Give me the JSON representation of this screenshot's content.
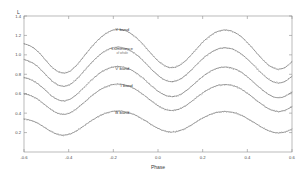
{
  "figure": {
    "background_color": "#ffffff",
    "frame_color": "#8d8d8d",
    "curve_color": "#6f6f6f",
    "point_color": "#5a5a5a"
  },
  "chart_data": {
    "type": "line",
    "title": "",
    "subtitle": "",
    "xlabel": "Phase",
    "ylabel": "L",
    "xlim": [
      -0.6,
      0.6
    ],
    "ylim": [
      0.0,
      1.4
    ],
    "grid": false,
    "legend_position": "inline-annotations",
    "xticks": [
      -0.6,
      -0.4,
      -0.2,
      0.0,
      0.2,
      0.4,
      0.6
    ],
    "xticklabels": [
      "-0.6",
      "-0.4",
      "-0.2",
      "0.0",
      "0.2",
      "0.4",
      "0.6"
    ],
    "yticks": [
      0.2,
      0.4,
      0.6,
      0.8,
      1.0,
      1.2,
      1.4
    ],
    "yticklabels": [
      "0.2",
      "0.4",
      "0.6",
      "0.8",
      "1.0",
      "1.2",
      "1.4"
    ],
    "annotations": [
      {
        "text": "Y band",
        "sub": "",
        "x": -0.16,
        "y": 1.245
      },
      {
        "text": "Luminance",
        "sub": "of whole",
        "x": -0.16,
        "y": 1.045
      },
      {
        "text": "V band",
        "sub": "",
        "x": -0.16,
        "y": 0.845
      },
      {
        "text": "I band",
        "sub": "",
        "x": -0.14,
        "y": 0.665
      },
      {
        "text": "B band",
        "sub": "",
        "x": -0.16,
        "y": 0.395
      }
    ],
    "series": [
      {
        "name": "Y band",
        "offset": 1.07,
        "amplitude": 0.175,
        "primary_min_depth": 0.3,
        "secondary_min_depth": 0.22,
        "x": [
          -0.6,
          -0.57,
          -0.54,
          -0.51,
          -0.48,
          -0.45,
          -0.42,
          -0.39,
          -0.36,
          -0.33,
          -0.3,
          -0.27,
          -0.24,
          -0.21,
          -0.18,
          -0.15,
          -0.12,
          -0.09,
          -0.06,
          -0.03,
          0.0,
          0.03,
          0.06,
          0.09,
          0.12,
          0.15,
          0.18,
          0.21,
          0.24,
          0.27,
          0.3,
          0.33,
          0.36,
          0.39,
          0.42,
          0.45,
          0.48,
          0.51,
          0.54,
          0.57,
          0.6
        ],
        "values": [
          1.115,
          1.09,
          1.04,
          0.965,
          0.885,
          0.83,
          0.812,
          0.838,
          0.905,
          0.99,
          1.075,
          1.15,
          1.21,
          1.248,
          1.262,
          1.252,
          1.218,
          1.162,
          1.09,
          1.01,
          0.938,
          0.888,
          0.868,
          0.884,
          0.932,
          1.002,
          1.08,
          1.152,
          1.208,
          1.244,
          1.256,
          1.244,
          1.208,
          1.15,
          1.078,
          0.998,
          0.925,
          0.872,
          0.852,
          0.872,
          0.93
        ]
      },
      {
        "name": "Luminance",
        "offset": 0.9,
        "amplitude": 0.155,
        "primary_min_depth": 0.28,
        "secondary_min_depth": 0.2,
        "x": [
          -0.6,
          -0.57,
          -0.54,
          -0.51,
          -0.48,
          -0.45,
          -0.42,
          -0.39,
          -0.36,
          -0.33,
          -0.3,
          -0.27,
          -0.24,
          -0.21,
          -0.18,
          -0.15,
          -0.12,
          -0.09,
          -0.06,
          -0.03,
          0.0,
          0.03,
          0.06,
          0.09,
          0.12,
          0.15,
          0.18,
          0.21,
          0.24,
          0.27,
          0.3,
          0.33,
          0.36,
          0.39,
          0.42,
          0.45,
          0.48,
          0.51,
          0.54,
          0.57,
          0.6
        ],
        "values": [
          0.952,
          0.928,
          0.882,
          0.815,
          0.742,
          0.692,
          0.676,
          0.7,
          0.76,
          0.838,
          0.915,
          0.982,
          1.035,
          1.068,
          1.08,
          1.07,
          1.04,
          0.99,
          0.925,
          0.852,
          0.788,
          0.742,
          0.724,
          0.738,
          0.782,
          0.845,
          0.916,
          0.98,
          1.03,
          1.062,
          1.072,
          1.062,
          1.03,
          0.978,
          0.914,
          0.842,
          0.776,
          0.728,
          0.71,
          0.728,
          0.78
        ]
      },
      {
        "name": "V band",
        "offset": 0.72,
        "amplitude": 0.135,
        "primary_min_depth": 0.26,
        "secondary_min_depth": 0.185,
        "x": [
          -0.6,
          -0.57,
          -0.54,
          -0.51,
          -0.48,
          -0.45,
          -0.42,
          -0.39,
          -0.36,
          -0.33,
          -0.3,
          -0.27,
          -0.24,
          -0.21,
          -0.18,
          -0.15,
          -0.12,
          -0.09,
          -0.06,
          -0.03,
          0.0,
          0.03,
          0.06,
          0.09,
          0.12,
          0.15,
          0.18,
          0.21,
          0.24,
          0.27,
          0.3,
          0.33,
          0.36,
          0.39,
          0.42,
          0.45,
          0.48,
          0.51,
          0.54,
          0.57,
          0.6
        ],
        "values": [
          0.768,
          0.746,
          0.706,
          0.648,
          0.584,
          0.54,
          0.526,
          0.548,
          0.6,
          0.668,
          0.736,
          0.795,
          0.842,
          0.87,
          0.881,
          0.872,
          0.846,
          0.802,
          0.745,
          0.682,
          0.626,
          0.586,
          0.57,
          0.582,
          0.62,
          0.676,
          0.738,
          0.794,
          0.838,
          0.866,
          0.875,
          0.866,
          0.838,
          0.792,
          0.736,
          0.673,
          0.616,
          0.574,
          0.558,
          0.574,
          0.618
        ]
      },
      {
        "name": "I band",
        "offset": 0.56,
        "amplitude": 0.12,
        "primary_min_depth": 0.24,
        "secondary_min_depth": 0.17,
        "x": [
          -0.6,
          -0.57,
          -0.54,
          -0.51,
          -0.48,
          -0.45,
          -0.42,
          -0.39,
          -0.36,
          -0.33,
          -0.3,
          -0.27,
          -0.24,
          -0.21,
          -0.18,
          -0.15,
          -0.12,
          -0.09,
          -0.06,
          -0.03,
          0.0,
          0.03,
          0.06,
          0.09,
          0.12,
          0.15,
          0.18,
          0.21,
          0.24,
          0.27,
          0.3,
          0.33,
          0.36,
          0.39,
          0.42,
          0.45,
          0.48,
          0.51,
          0.54,
          0.57,
          0.6
        ],
        "values": [
          0.6,
          0.58,
          0.545,
          0.494,
          0.438,
          0.4,
          0.388,
          0.407,
          0.452,
          0.512,
          0.572,
          0.624,
          0.665,
          0.69,
          0.7,
          0.692,
          0.669,
          0.63,
          0.58,
          0.525,
          0.476,
          0.441,
          0.427,
          0.438,
          0.471,
          0.52,
          0.574,
          0.623,
          0.662,
          0.686,
          0.694,
          0.686,
          0.662,
          0.621,
          0.571,
          0.516,
          0.466,
          0.43,
          0.416,
          0.43,
          0.468
        ]
      },
      {
        "name": "B band",
        "offset": 0.315,
        "amplitude": 0.1,
        "primary_min_depth": 0.21,
        "secondary_min_depth": 0.15,
        "x": [
          -0.6,
          -0.57,
          -0.54,
          -0.51,
          -0.48,
          -0.45,
          -0.42,
          -0.39,
          -0.36,
          -0.33,
          -0.3,
          -0.27,
          -0.24,
          -0.21,
          -0.18,
          -0.15,
          -0.12,
          -0.09,
          -0.06,
          -0.03,
          0.0,
          0.03,
          0.06,
          0.09,
          0.12,
          0.15,
          0.18,
          0.21,
          0.24,
          0.27,
          0.3,
          0.33,
          0.36,
          0.39,
          0.42,
          0.45,
          0.48,
          0.51,
          0.54,
          0.57,
          0.6
        ],
        "values": [
          0.342,
          0.326,
          0.298,
          0.256,
          0.212,
          0.182,
          0.172,
          0.188,
          0.224,
          0.272,
          0.32,
          0.362,
          0.395,
          0.415,
          0.423,
          0.416,
          0.398,
          0.367,
          0.327,
          0.283,
          0.244,
          0.216,
          0.205,
          0.214,
          0.24,
          0.279,
          0.322,
          0.361,
          0.392,
          0.411,
          0.418,
          0.411,
          0.392,
          0.359,
          0.319,
          0.275,
          0.235,
          0.207,
          0.196,
          0.207,
          0.237
        ]
      }
    ]
  }
}
